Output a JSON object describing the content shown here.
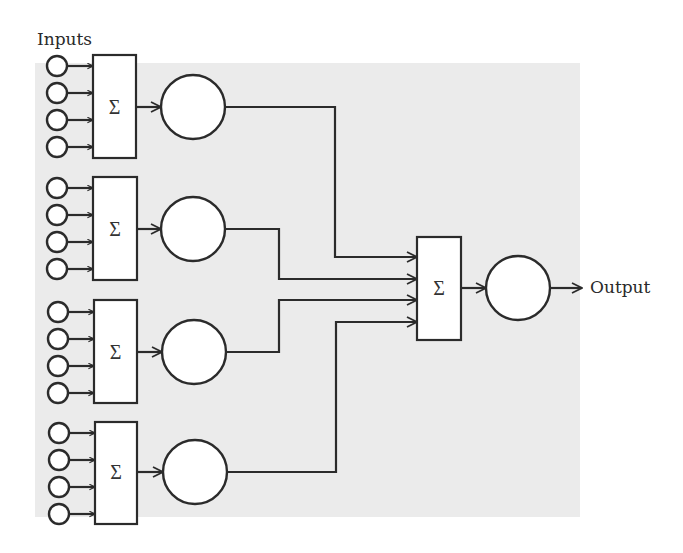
{
  "diagram": {
    "type": "neural-network-ensemble",
    "labels": {
      "inputs": "Inputs",
      "output": "Output",
      "sum_symbol": "Σ"
    },
    "colors": {
      "stroke": "#2b2b2b",
      "node_fill": "#ffffff",
      "background_panel": "#ebebeb",
      "page": "#ffffff"
    },
    "groups": [
      {
        "id": "group-1",
        "inputs_count": 4,
        "input_y": [
          66,
          93,
          120,
          147
        ],
        "box": {
          "x": 93,
          "y": 55,
          "w": 43,
          "h": 103
        },
        "neuron": {
          "cx": 193,
          "cy": 107,
          "r": 32
        },
        "route_x": 335,
        "target_y": 257
      },
      {
        "id": "group-2",
        "inputs_count": 4,
        "input_y": [
          188,
          215,
          242,
          269
        ],
        "box": {
          "x": 93,
          "y": 177,
          "w": 44,
          "h": 103
        },
        "neuron": {
          "cx": 193,
          "cy": 229,
          "r": 32
        },
        "route_x": 279,
        "target_y": 279
      },
      {
        "id": "group-3",
        "inputs_count": 4,
        "input_y": [
          312,
          339,
          366,
          393
        ],
        "box": {
          "x": 94,
          "y": 300,
          "w": 43,
          "h": 103
        },
        "neuron": {
          "cx": 194,
          "cy": 352,
          "r": 32
        },
        "route_x": 279,
        "target_y": 300
      },
      {
        "id": "group-4",
        "inputs_count": 4,
        "input_y": [
          433,
          460,
          487,
          514
        ],
        "box": {
          "x": 95,
          "y": 422,
          "w": 42,
          "h": 102
        },
        "neuron": {
          "cx": 195,
          "cy": 472,
          "r": 32
        },
        "route_x": 336,
        "target_y": 322
      }
    ],
    "combiner": {
      "box": {
        "x": 417,
        "y": 237,
        "w": 44,
        "h": 103
      },
      "neuron": {
        "cx": 518,
        "cy": 288,
        "r": 32
      },
      "output_arrow_end_x": 582
    }
  }
}
